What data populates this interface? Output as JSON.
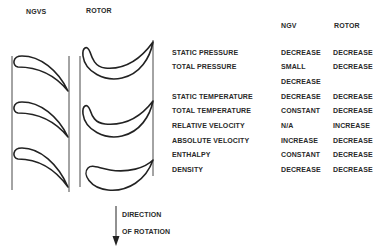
{
  "diagram": {
    "labels": {
      "ngvs": "NGVS",
      "rotor": "ROTOR"
    },
    "direction_label": [
      "DIRECTION",
      "OF ROTATION"
    ]
  },
  "table": {
    "headers": {
      "ngv": "NGV",
      "rotor": "ROTOR"
    },
    "rows": [
      {
        "property": "STATIC PRESSURE",
        "ngv": "DECREASE",
        "rotor": "DECREASE"
      },
      {
        "property": "TOTAL PRESSURE",
        "ngv": "SMALL",
        "ngv2": "DECREASE",
        "rotor": "DECREASE"
      },
      {
        "property": "STATIC TEMPERATURE",
        "ngv": "DECREASE",
        "rotor": "DECREASE"
      },
      {
        "property": "TOTAL TEMPERATURE",
        "ngv": "CONSTANT",
        "rotor": "DECREASE"
      },
      {
        "property": "RELATIVE VELOCITY",
        "ngv": "N/A",
        "rotor": "INCREASE"
      },
      {
        "property": "ABSOLUTE VELOCITY",
        "ngv": "INCREASE",
        "rotor": "DECREASE"
      },
      {
        "property": "ENTHALPY",
        "ngv": "CONSTANT",
        "rotor": "DECREASE"
      },
      {
        "property": "DENSITY",
        "ngv": "DECREASE",
        "rotor": "DECREASE"
      }
    ]
  }
}
